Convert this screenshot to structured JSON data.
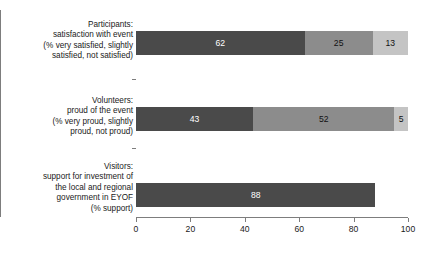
{
  "chart_data": {
    "type": "bar",
    "orientation": "horizontal",
    "stacked": true,
    "title": "",
    "xlabel": "",
    "ylabel": "",
    "xlim": [
      0,
      100
    ],
    "xticks": [
      0,
      20,
      40,
      60,
      80,
      100
    ],
    "grid": false,
    "legend": "none",
    "categories": [
      "Participants:\nsatisfaction with event\n(% very satisfied, slightly\nsatisfied, not satisfied)",
      "Volunteers:\nproud of the event\n(% very proud, slightly\nproud, not proud)",
      "Visitors:\nsupport for investment of\nthe local and regional\ngovernment in EYOF\n(% support)"
    ],
    "series": [
      {
        "name": "very positive",
        "values": [
          62,
          43,
          88
        ],
        "color": "#4a4a4a"
      },
      {
        "name": "slightly positive",
        "values": [
          25,
          52,
          null
        ],
        "color": "#8c8c8c"
      },
      {
        "name": "not positive",
        "values": [
          13,
          5,
          null
        ],
        "color": "#c4c4c4"
      }
    ],
    "bars": [
      {
        "category_index": 0,
        "segments": [
          {
            "value": 62,
            "label": "62",
            "color": "#4a4a4a"
          },
          {
            "value": 25,
            "label": "25",
            "color": "#8c8c8c"
          },
          {
            "value": 13,
            "label": "13",
            "color": "#c4c4c4"
          }
        ]
      },
      {
        "category_index": 1,
        "segments": [
          {
            "value": 43,
            "label": "43",
            "color": "#4a4a4a"
          },
          {
            "value": 52,
            "label": "52",
            "color": "#8c8c8c"
          },
          {
            "value": 5,
            "label": "5",
            "color": "#c4c4c4"
          }
        ]
      },
      {
        "category_index": 2,
        "segments": [
          {
            "value": 88,
            "label": "88",
            "color": "#4a4a4a"
          }
        ]
      }
    ]
  },
  "axis": {
    "tick_labels": [
      "0",
      "20",
      "40",
      "60",
      "80",
      "100"
    ]
  }
}
